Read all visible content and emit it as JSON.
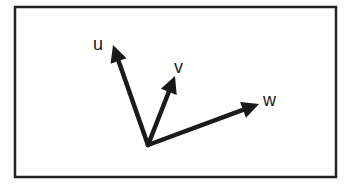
{
  "diagram": {
    "frame": {
      "x": 15,
      "y": 7,
      "width": 321,
      "height": 170,
      "stroke": "#222222",
      "stroke_width": 2.5
    },
    "origin": {
      "x": 148,
      "y": 145
    },
    "stroke_color": "#1a1a1a",
    "vectors": [
      {
        "name": "u",
        "label": "u",
        "tip": {
          "x": 113,
          "y": 45
        },
        "label_pos": {
          "x": 93,
          "y": 50
        }
      },
      {
        "name": "v",
        "label": "v",
        "tip": {
          "x": 175,
          "y": 76
        },
        "label_pos": {
          "x": 174,
          "y": 73
        }
      },
      {
        "name": "w",
        "label": "w",
        "tip": {
          "x": 259,
          "y": 104
        },
        "label_pos": {
          "x": 263,
          "y": 106
        }
      }
    ]
  }
}
